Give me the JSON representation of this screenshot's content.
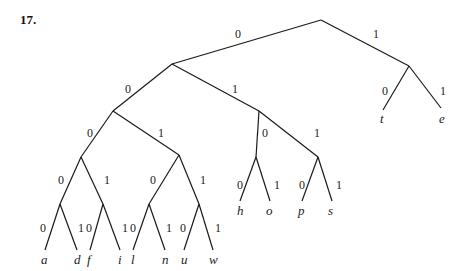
{
  "problem_number": "17.",
  "tree": {
    "description": "Binary prefix code tree",
    "nodes": {
      "root": {
        "x": 321,
        "y": 20
      },
      "n0": {
        "x": 172,
        "y": 64
      },
      "n1": {
        "x": 409,
        "y": 66
      },
      "n00": {
        "x": 113,
        "y": 111
      },
      "n01": {
        "x": 259,
        "y": 111
      },
      "n000": {
        "x": 81,
        "y": 157
      },
      "n001": {
        "x": 179,
        "y": 155
      },
      "n010": {
        "x": 256,
        "y": 157
      },
      "n011": {
        "x": 318,
        "y": 157
      },
      "n0000": {
        "x": 60,
        "y": 204
      },
      "n0001": {
        "x": 103,
        "y": 204
      },
      "n0010": {
        "x": 149,
        "y": 204
      },
      "n0011": {
        "x": 199,
        "y": 204
      }
    },
    "edges": [
      {
        "from": "root",
        "to": "n0",
        "bit": "0",
        "lx": 235,
        "ly": 38
      },
      {
        "from": "root",
        "to": "n1",
        "bit": "1",
        "lx": 373,
        "ly": 38
      },
      {
        "from": "n0",
        "to": "n00",
        "bit": "0",
        "lx": 125,
        "ly": 93
      },
      {
        "from": "n0",
        "to": "n01",
        "bit": "1",
        "lx": 232,
        "ly": 93
      },
      {
        "from": "n00",
        "to": "n000",
        "bit": "0",
        "lx": 87,
        "ly": 137
      },
      {
        "from": "n00",
        "to": "n001",
        "bit": "1",
        "lx": 158,
        "ly": 137
      },
      {
        "from": "n01",
        "to": "n010",
        "bit": "0",
        "lx": 262,
        "ly": 137
      },
      {
        "from": "n01",
        "to": "n011",
        "bit": "1",
        "lx": 314,
        "ly": 137
      },
      {
        "from": "n000",
        "to": "n0000",
        "bit": "0",
        "lx": 58,
        "ly": 184
      },
      {
        "from": "n000",
        "to": "n0001",
        "bit": "1",
        "lx": 104,
        "ly": 184
      },
      {
        "from": "n001",
        "to": "n0010",
        "bit": "0",
        "lx": 150,
        "ly": 184
      },
      {
        "from": "n001",
        "to": "n0011",
        "bit": "1",
        "lx": 200,
        "ly": 184
      }
    ],
    "leaves": [
      {
        "parent": "n1",
        "label": "t",
        "bit": "0",
        "x": 383,
        "y": 110,
        "lx": 382,
        "ly": 95,
        "tx": 380,
        "ty": 123
      },
      {
        "parent": "n1",
        "label": "e",
        "bit": "1",
        "x": 441,
        "y": 108,
        "lx": 440,
        "ly": 95,
        "tx": 439,
        "ty": 123
      },
      {
        "parent": "n010",
        "label": "h",
        "bit": "0",
        "x": 240,
        "y": 201,
        "lx": 237,
        "ly": 189,
        "tx": 237,
        "ty": 215
      },
      {
        "parent": "n010",
        "label": "o",
        "bit": "1",
        "x": 270,
        "y": 201,
        "lx": 274,
        "ly": 189,
        "tx": 266,
        "ty": 215
      },
      {
        "parent": "n011",
        "label": "p",
        "bit": "0",
        "x": 302,
        "y": 201,
        "lx": 299,
        "ly": 189,
        "tx": 298,
        "ty": 215
      },
      {
        "parent": "n011",
        "label": "s",
        "bit": "1",
        "x": 332,
        "y": 201,
        "lx": 336,
        "ly": 189,
        "tx": 328,
        "ty": 215
      },
      {
        "parent": "n0000",
        "label": "a",
        "bit": "0",
        "x": 45,
        "y": 250,
        "lx": 40,
        "ly": 232,
        "tx": 41,
        "ty": 264
      },
      {
        "parent": "n0000",
        "label": "d",
        "bit": "1",
        "x": 77,
        "y": 250,
        "lx": 78,
        "ly": 232,
        "tx": 74,
        "ty": 264
      },
      {
        "parent": "n0001",
        "label": "f",
        "bit": "0",
        "x": 90,
        "y": 250,
        "lx": 86,
        "ly": 232,
        "tx": 87,
        "ty": 264
      },
      {
        "parent": "n0001",
        "label": "i",
        "bit": "1",
        "x": 120,
        "y": 250,
        "lx": 122,
        "ly": 232,
        "tx": 118,
        "ty": 264
      },
      {
        "parent": "n0010",
        "label": "l",
        "bit": "0",
        "x": 133,
        "y": 250,
        "lx": 130,
        "ly": 232,
        "tx": 131,
        "ty": 264
      },
      {
        "parent": "n0010",
        "label": "n",
        "bit": "1",
        "x": 165,
        "y": 250,
        "lx": 166,
        "ly": 232,
        "tx": 162,
        "ty": 264
      },
      {
        "parent": "n0011",
        "label": "u",
        "bit": "0",
        "x": 184,
        "y": 250,
        "lx": 180,
        "ly": 232,
        "tx": 181,
        "ty": 264
      },
      {
        "parent": "n0011",
        "label": "w",
        "bit": "1",
        "x": 213,
        "y": 250,
        "lx": 215,
        "ly": 232,
        "tx": 209,
        "ty": 264
      }
    ]
  }
}
